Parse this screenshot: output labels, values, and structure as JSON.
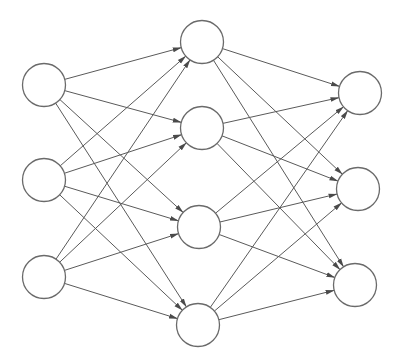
{
  "diagram": {
    "type": "feedforward-neural-network",
    "background": "#ffffff",
    "edge_color": "#5a5a5a",
    "node_stroke": "#6a6a6a",
    "node_radius": 21.5,
    "layers": [
      {
        "name": "input",
        "nodes": [
          {
            "id": "i1",
            "x": 44,
            "y": 85
          },
          {
            "id": "i2",
            "x": 44,
            "y": 180
          },
          {
            "id": "i3",
            "x": 44,
            "y": 277
          }
        ]
      },
      {
        "name": "hidden",
        "nodes": [
          {
            "id": "h1",
            "x": 202,
            "y": 42
          },
          {
            "id": "h2",
            "x": 202,
            "y": 128
          },
          {
            "id": "h3",
            "x": 199,
            "y": 227
          },
          {
            "id": "h4",
            "x": 198,
            "y": 325
          }
        ]
      },
      {
        "name": "output",
        "nodes": [
          {
            "id": "o1",
            "x": 360,
            "y": 93
          },
          {
            "id": "o2",
            "x": 358,
            "y": 189
          },
          {
            "id": "o3",
            "x": 355,
            "y": 285
          }
        ]
      }
    ],
    "connectivity": "fully-connected",
    "edge_style": "arrow"
  }
}
